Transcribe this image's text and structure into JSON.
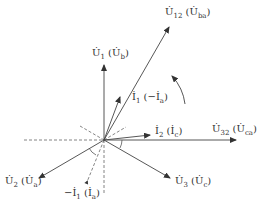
{
  "diagram": {
    "type": "phasor-diagram",
    "origin": [
      104,
      140
    ],
    "rotation_direction": "counter-clockwise",
    "phasors": [
      {
        "id": "U12",
        "label": "U̇12 (U̇ba)",
        "main": "U̇",
        "sub": "12",
        "alt_main": "U̇",
        "alt_sub": "ba",
        "end": [
          170,
          26
        ],
        "style": "solid"
      },
      {
        "id": "U1",
        "label": "U̇1 (U̇b)",
        "main": "U̇",
        "sub": "1",
        "alt_main": "U̇",
        "alt_sub": "b",
        "end": [
          104,
          65
        ],
        "style": "solid"
      },
      {
        "id": "I1",
        "label": "İ1 (−İa)",
        "main": "İ",
        "sub": "1",
        "alt_main": "−İ",
        "alt_sub": "a",
        "end": [
          120,
          96
        ],
        "style": "solid"
      },
      {
        "id": "I2",
        "label": "İ2 (İc)",
        "main": "İ",
        "sub": "2",
        "alt_main": "İ",
        "alt_sub": "c",
        "end": [
          150,
          135
        ],
        "style": "solid"
      },
      {
        "id": "U32",
        "label": "U̇32 (U̇ca)",
        "main": "U̇",
        "sub": "32",
        "alt_main": "U̇",
        "alt_sub": "ca",
        "end": [
          236,
          140
        ],
        "style": "solid"
      },
      {
        "id": "U3",
        "label": "U̇3 (U̇c)",
        "main": "U̇",
        "sub": "3",
        "alt_main": "U̇",
        "alt_sub": "c",
        "end": [
          170,
          178
        ],
        "style": "solid"
      },
      {
        "id": "U2",
        "label": "U̇2 (U̇a)",
        "main": "U̇",
        "sub": "2",
        "alt_main": "U̇",
        "alt_sub": "a",
        "end": [
          38,
          178
        ],
        "style": "solid"
      },
      {
        "id": "-I1",
        "label": "−İ1 (İa)",
        "main": "−İ",
        "sub": "1",
        "alt_main": "İ",
        "alt_sub": "a",
        "end": [
          87,
          184
        ],
        "style": "dashed"
      }
    ],
    "labels": {
      "U12": {
        "pre": "U̇",
        "sub": "12",
        "paren_pre": "U̇",
        "paren_sub": "ba"
      },
      "U1": {
        "pre": "U̇",
        "sub": "1",
        "paren_pre": "U̇",
        "paren_sub": "b"
      },
      "I1": {
        "pre": "İ",
        "sub": "1",
        "paren_pre": "−İ",
        "paren_sub": "a"
      },
      "I2": {
        "pre": "İ",
        "sub": "2",
        "paren_pre": "İ",
        "paren_sub": "c"
      },
      "U32": {
        "pre": "U̇",
        "sub": "32",
        "paren_pre": "U̇",
        "paren_sub": "ca"
      },
      "U3": {
        "pre": "U̇",
        "sub": "3",
        "paren_pre": "U̇",
        "paren_sub": "c"
      },
      "U2": {
        "pre": "U̇",
        "sub": "2",
        "paren_pre": "U̇",
        "paren_sub": "a"
      },
      "mI1": {
        "pre": "−İ",
        "sub": "1",
        "paren_pre": "İ",
        "paren_sub": "a"
      }
    },
    "colors": {
      "line": "#444444",
      "dash": "#555555",
      "text": "#333333"
    }
  }
}
